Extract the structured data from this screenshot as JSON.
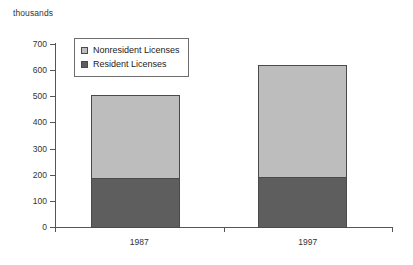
{
  "chart_data": {
    "type": "bar",
    "subtype": "stacked-bar",
    "title": "",
    "subtitle": "",
    "xlabel": "",
    "ylabel": "thousands",
    "unit_caption": "thousands",
    "categories": [
      "1987",
      "1997"
    ],
    "series": [
      {
        "name": "Resident Licenses",
        "color": "#5e5e5e",
        "values": [
          188,
          190
        ]
      },
      {
        "name": "Nonresident Licenses",
        "color": "#bdbdbd",
        "values": [
          317,
          430
        ]
      }
    ],
    "stack_order": [
      "Resident Licenses",
      "Nonresident Licenses"
    ],
    "totals": [
      505,
      620
    ],
    "ylim": [
      0,
      700
    ],
    "ytick_step": 100,
    "yticks": [
      0,
      100,
      200,
      300,
      400,
      500,
      600,
      700
    ],
    "ytick_labels": [
      "0",
      "100",
      "200",
      "300",
      "400",
      "500",
      "600",
      "700"
    ],
    "grid": false,
    "legend_position": "inside-top-left",
    "legend_entries": [
      "Nonresident Licenses",
      "Resident Licenses"
    ]
  },
  "axis": {
    "unit_caption": "thousands"
  },
  "legend": {
    "items": [
      {
        "label": "Nonresident Licenses",
        "color": "#bdbdbd"
      },
      {
        "label": "Resident Licenses",
        "color": "#5e5e5e"
      }
    ]
  }
}
